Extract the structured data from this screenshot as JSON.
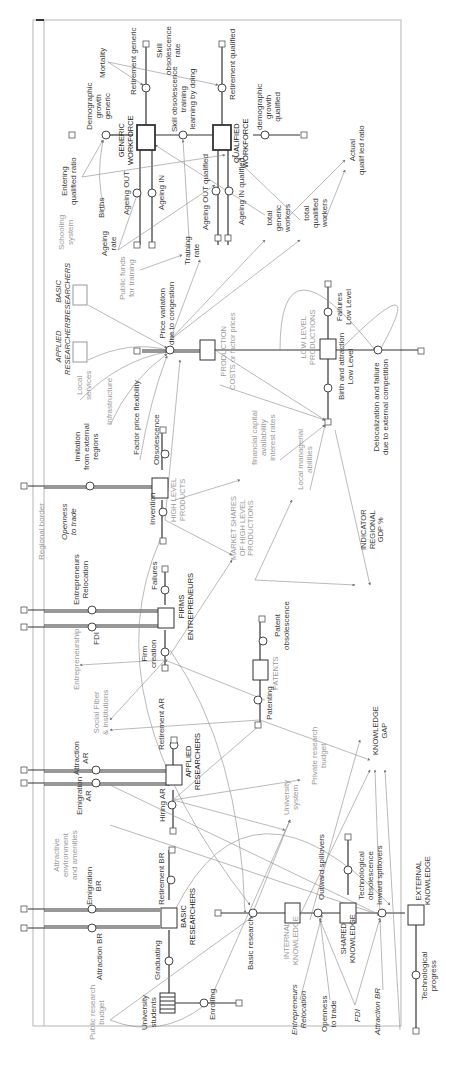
{
  "diagram": {
    "border_label": "Regional border",
    "labels": [
      {
        "id": "mortality",
        "text": "Mortality",
        "x": 98,
        "y": 78,
        "cls": ""
      },
      {
        "id": "retirement_generic",
        "text": "Retirement generic",
        "x": 129,
        "y": 95,
        "cls": ""
      },
      {
        "id": "skill_obsolescence_rate",
        "text": "Skill\nobsolescence\nrate",
        "x": 155,
        "y": 75,
        "cls": ""
      },
      {
        "id": "demographic_growth_generic",
        "text": "Demographic\ngrowth\ngeneric",
        "x": 85,
        "y": 130,
        "cls": ""
      },
      {
        "id": "skill_obsolescence_training",
        "text": "Skill obsolescence\ntraining\nlearning by doing",
        "x": 170,
        "y": 132,
        "cls": ""
      },
      {
        "id": "retirement_qualified",
        "text": "Retirement qualified",
        "x": 228,
        "y": 100,
        "cls": ""
      },
      {
        "id": "generic_workforce",
        "text": "GENERIC\nWORKFORCE",
        "x": 118,
        "y": 165,
        "cls": "bold caps"
      },
      {
        "id": "qualified_workforce",
        "text": "QUALIFIED\nWORKFORCE",
        "x": 233,
        "y": 168,
        "cls": "bold caps"
      },
      {
        "id": "demographic_growth_qualified",
        "text": "demographic\ngrowth\nqualified",
        "x": 255,
        "y": 130,
        "cls": ""
      },
      {
        "id": "entering_qualified_ratio",
        "text": "Entering\nqualified ratio",
        "x": 60,
        "y": 205,
        "cls": ""
      },
      {
        "id": "births",
        "text": "Births",
        "x": 97,
        "y": 218,
        "cls": ""
      },
      {
        "id": "ageing_out",
        "text": "Ageing OUT",
        "x": 122,
        "y": 215,
        "cls": ""
      },
      {
        "id": "ageing_in",
        "text": "Ageing IN",
        "x": 157,
        "y": 210,
        "cls": ""
      },
      {
        "id": "ageing_out_qualified",
        "text": "Ageing OUT qualified",
        "x": 201,
        "y": 230,
        "cls": ""
      },
      {
        "id": "ageing_in_qualified",
        "text": "Ageing IN qualified",
        "x": 237,
        "y": 225,
        "cls": ""
      },
      {
        "id": "schooling_system",
        "text": "Schooling\nsystem",
        "x": 57,
        "y": 250,
        "cls": "gray"
      },
      {
        "id": "ageing_rate",
        "text": "Ageing\nrate",
        "x": 100,
        "y": 256,
        "cls": ""
      },
      {
        "id": "training_rate",
        "text": "Training\nrate",
        "x": 183,
        "y": 265,
        "cls": ""
      },
      {
        "id": "total_generic_workers",
        "text": "total\ngeneric\nworkers",
        "x": 265,
        "y": 232,
        "cls": ""
      },
      {
        "id": "total_qualified_workers",
        "text": "total\nqualified\nworkers",
        "x": 302,
        "y": 228,
        "cls": ""
      },
      {
        "id": "actual_qualified_ratio",
        "text": "Actual\nqualif ied ratio",
        "x": 348,
        "y": 175,
        "cls": ""
      },
      {
        "id": "public_funds_training",
        "text": "Public funds\nfor training",
        "x": 118,
        "y": 300,
        "cls": "gray"
      },
      {
        "id": "basic_researchers_ghost",
        "text": "BASIC\nRESEARCHERS",
        "x": 55,
        "y": 320,
        "cls": "it caps"
      },
      {
        "id": "applied_researchers_ghost",
        "text": "APPLIED\nRESEARCHERS",
        "x": 55,
        "y": 375,
        "cls": "it caps"
      },
      {
        "id": "price_variation",
        "text": "Price variation\ndue to congestion",
        "x": 158,
        "y": 345,
        "cls": ""
      },
      {
        "id": "production_costs",
        "text": "PRODUCTION\nCOSTS or factor prices",
        "x": 220,
        "y": 390,
        "cls": "gray caps"
      },
      {
        "id": "low_level_productions",
        "text": "LOW LEVEL\nPRODUCTIONS",
        "x": 300,
        "y": 365,
        "cls": "gray caps"
      },
      {
        "id": "failures_low_level",
        "text": "Failures\nLow Level",
        "x": 335,
        "y": 325,
        "cls": ""
      },
      {
        "id": "birth_attraction_low_level",
        "text": "Birth and attraction\nLow Level",
        "x": 337,
        "y": 400,
        "cls": ""
      },
      {
        "id": "delocalization",
        "text": "Delocalization and failure\ndue to external competition",
        "x": 372,
        "y": 455,
        "cls": ""
      },
      {
        "id": "local_services",
        "text": "Local\nservices",
        "x": 75,
        "y": 400,
        "cls": "gray"
      },
      {
        "id": "infrastructure",
        "text": "Infrastructure",
        "x": 105,
        "y": 425,
        "cls": "gray"
      },
      {
        "id": "factor_price_flexibility",
        "text": "Factor price flexibility",
        "x": 132,
        "y": 455,
        "cls": ""
      },
      {
        "id": "imitation",
        "text": "Imitation\nfrom external\nregions",
        "x": 73,
        "y": 470,
        "cls": ""
      },
      {
        "id": "obsolescence",
        "text": "Obsolescence",
        "x": 152,
        "y": 465,
        "cls": ""
      },
      {
        "id": "financial_capital",
        "text": "financial capital\navailability\ninterest rates",
        "x": 250,
        "y": 465,
        "cls": "gray"
      },
      {
        "id": "local_managerial",
        "text": "Local managerial\nabilities",
        "x": 296,
        "y": 490,
        "cls": "gray"
      },
      {
        "id": "high_level_products",
        "text": "HIGH LEVEL\nPRODUCTS",
        "x": 170,
        "y": 522,
        "cls": "gray caps"
      },
      {
        "id": "invention",
        "text": "Invention",
        "x": 148,
        "y": 525,
        "cls": ""
      },
      {
        "id": "openness_to_trade_top",
        "text": "Openness\nto trade",
        "x": 60,
        "y": 540,
        "cls": "it"
      },
      {
        "id": "market_shares",
        "text": "MARKET SHARES\nOF HIGH LEVEL\nPRODUCTIONS",
        "x": 230,
        "y": 560,
        "cls": "gray caps"
      },
      {
        "id": "indicator_gdp",
        "text": "INDICATOR\nREGIONAL\nGDP %",
        "x": 360,
        "y": 550,
        "cls": "caps"
      },
      {
        "id": "entrepreneurs_relocation",
        "text": "Entrepreneurs\nRelocation",
        "x": 72,
        "y": 605,
        "cls": ""
      },
      {
        "id": "failures",
        "text": "Failures",
        "x": 150,
        "y": 590,
        "cls": ""
      },
      {
        "id": "firms_entrepreneurs",
        "text": "FIRMS\nENTREPRENEURS",
        "x": 178,
        "y": 640,
        "cls": "bold caps"
      },
      {
        "id": "fdi",
        "text": "FDI",
        "x": 92,
        "y": 645,
        "cls": ""
      },
      {
        "id": "entrepreneurship",
        "text": "Entrepreneurship",
        "x": 72,
        "y": 690,
        "cls": "gray"
      },
      {
        "id": "firm_creation",
        "text": "Firm\ncreation",
        "x": 140,
        "y": 668,
        "cls": ""
      },
      {
        "id": "patent_obsolescence",
        "text": "Patent\nobsolescence",
        "x": 273,
        "y": 650,
        "cls": ""
      },
      {
        "id": "patents",
        "text": "PATENTS",
        "x": 272,
        "y": 690,
        "cls": "gray caps"
      },
      {
        "id": "social_fiber",
        "text": "Social Fiber\n& institutions",
        "x": 92,
        "y": 735,
        "cls": "gray"
      },
      {
        "id": "patenting",
        "text": "Patenting",
        "x": 265,
        "y": 720,
        "cls": ""
      },
      {
        "id": "retirement_ar",
        "text": "Retirement AR",
        "x": 157,
        "y": 750,
        "cls": ""
      },
      {
        "id": "knowledge_gap",
        "text": "KNOWLEDGE\nGAP",
        "x": 372,
        "y": 755,
        "cls": "caps"
      },
      {
        "id": "attraction_ar",
        "text": "Attraction\nAR",
        "x": 72,
        "y": 775,
        "cls": ""
      },
      {
        "id": "applied_researchers",
        "text": "APPLIED\nRESEARCHERS",
        "x": 185,
        "y": 790,
        "cls": "bold caps"
      },
      {
        "id": "private_research_budget",
        "text": "Private research\nbudget",
        "x": 310,
        "y": 785,
        "cls": "gray"
      },
      {
        "id": "emigration_ar",
        "text": "Emigration\nAR",
        "x": 75,
        "y": 815,
        "cls": ""
      },
      {
        "id": "hiring_ar",
        "text": "Hiring AR",
        "x": 158,
        "y": 822,
        "cls": ""
      },
      {
        "id": "university_system",
        "text": "University\nsystem",
        "x": 282,
        "y": 815,
        "cls": "gray"
      },
      {
        "id": "attractive_environment",
        "text": "Attractive\nenvironment\nand amenities",
        "x": 52,
        "y": 880,
        "cls": "gray"
      },
      {
        "id": "emigration_br",
        "text": "Emigration\nBR",
        "x": 85,
        "y": 905,
        "cls": ""
      },
      {
        "id": "retirement_br",
        "text": "Retirement BR",
        "x": 157,
        "y": 905,
        "cls": ""
      },
      {
        "id": "technological_obsolescence",
        "text": "Technological\nobsolescence",
        "x": 357,
        "y": 900,
        "cls": ""
      },
      {
        "id": "outward_spillovers",
        "text": "Outward spillovers",
        "x": 317,
        "y": 900,
        "cls": ""
      },
      {
        "id": "inward_spillovers",
        "text": "Inward spillovers",
        "x": 375,
        "y": 905,
        "cls": ""
      },
      {
        "id": "basic_researchers",
        "text": "BASIC\nRESEARCHERS",
        "x": 180,
        "y": 945,
        "cls": "bold caps"
      },
      {
        "id": "external_knowledge",
        "text": "EXTERNAL\nKNOWLEDGE",
        "x": 415,
        "y": 905,
        "cls": "caps"
      },
      {
        "id": "internal_knowledge",
        "text": "INTERNAL\nKNOWLEDGE",
        "x": 283,
        "y": 965,
        "cls": "gray caps"
      },
      {
        "id": "shared_knowledge",
        "text": "SHARED\nKNOWLEDGE",
        "x": 340,
        "y": 963,
        "cls": "caps"
      },
      {
        "id": "attraction_br_top",
        "text": "Attraction BR",
        "x": 95,
        "y": 980,
        "cls": ""
      },
      {
        "id": "graduating",
        "text": "Graduating",
        "x": 153,
        "y": 980,
        "cls": ""
      },
      {
        "id": "basic_research",
        "text": "Basic research",
        "x": 246,
        "y": 970,
        "cls": ""
      },
      {
        "id": "public_research_budget",
        "text": "Public research\nbudget",
        "x": 88,
        "y": 1040,
        "cls": "gray"
      },
      {
        "id": "university_students",
        "text": "University\nstudents",
        "x": 140,
        "y": 1030,
        "cls": ""
      },
      {
        "id": "enrolling",
        "text": "Enrolling",
        "x": 208,
        "y": 1020,
        "cls": ""
      },
      {
        "id": "entrepreneurs_relocation_bottom",
        "text": "Entrepreneurs\nRelocation",
        "x": 290,
        "y": 1035,
        "cls": "it"
      },
      {
        "id": "openness_to_trade_bottom",
        "text": "Openness\nto trade",
        "x": 320,
        "y": 1032,
        "cls": ""
      },
      {
        "id": "fdi_bottom",
        "text": "FDI",
        "x": 353,
        "y": 1022,
        "cls": "it"
      },
      {
        "id": "attraction_br_bottom",
        "text": "Attraction BR",
        "x": 373,
        "y": 1035,
        "cls": "it"
      },
      {
        "id": "technological_progress",
        "text": "Technological\nprogress",
        "x": 420,
        "y": 1000,
        "cls": ""
      }
    ]
  }
}
